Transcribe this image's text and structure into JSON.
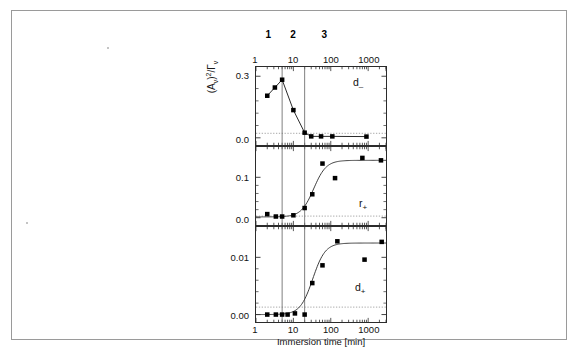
{
  "figure": {
    "y_axis_title_html": "(A<sub>v</sub>)<sup>2</sup>/Γ<sub>v</sub>",
    "y_axis_title_text": "(Av)2/Γv",
    "x_axis_title": "Immersion time [min]",
    "x_tick_labels": [
      "1",
      "10",
      "100",
      "1000"
    ],
    "x_tick_values": [
      1,
      10,
      100,
      1000
    ],
    "region_labels": [
      "1",
      "2",
      "3"
    ],
    "region_boundaries": [
      5,
      20
    ],
    "axis_color": "#2b2b2b",
    "marker_color": "#000000",
    "guide_color": "#6e6e6e",
    "dotted_color": "#9b9b9b"
  },
  "panels": [
    {
      "name": "d_minus",
      "label_html": "d<sub>–</sub>",
      "label_text": "d-",
      "y_tick_labels": [
        "0.3",
        "0.0"
      ],
      "y_tick_values": [
        0.3,
        0.0
      ],
      "y_limits": [
        -0.035,
        0.345
      ],
      "dotted_level": 0.022
    },
    {
      "name": "r_plus",
      "label_html": "r<sub>+</sub>",
      "label_text": "r+",
      "y_tick_labels": [
        "0.1",
        "0.0"
      ],
      "y_tick_values": [
        0.1,
        0.0
      ],
      "y_limits": [
        -0.018,
        0.175
      ],
      "dotted_level": 0.004
    },
    {
      "name": "d_plus",
      "label_html": "d<sub>+</sub>",
      "label_text": "d+",
      "y_tick_labels": [
        "0.01",
        "0.00"
      ],
      "y_tick_values": [
        0.01,
        0.0
      ],
      "y_limits": [
        -0.0013,
        0.0153
      ],
      "dotted_level": 0.0013
    }
  ],
  "chart_data": [
    {
      "type": "scatter",
      "title": "d–",
      "xlabel": "Immersion time [min]",
      "ylabel": "(Av)2/Γv",
      "xscale": "log",
      "xlim": [
        1,
        3000
      ],
      "ylim": [
        -0.035,
        0.345
      ],
      "grid": false,
      "legend": "none",
      "annotations": [
        "d–",
        "region 1",
        "region 2",
        "region 3"
      ],
      "vertical_lines": [
        5,
        20
      ],
      "dotted_horizontal_line": 0.022,
      "x": [
        2,
        3.2,
        5,
        10,
        20,
        30,
        55,
        110,
        900
      ],
      "y": [
        0.205,
        0.245,
        0.283,
        0.135,
        0.025,
        0.007,
        0.007,
        0.007,
        0.006
      ],
      "connected": true
    },
    {
      "type": "scatter",
      "title": "r+",
      "xlabel": "Immersion time [min]",
      "ylabel": "(Av)2/Γv",
      "xscale": "log",
      "xlim": [
        1,
        3000
      ],
      "ylim": [
        -0.018,
        0.175
      ],
      "grid": false,
      "legend": "none",
      "annotations": [
        "r+",
        "region 1",
        "region 2",
        "region 3"
      ],
      "vertical_lines": [
        5,
        20
      ],
      "dotted_horizontal_line": 0.004,
      "x": [
        2,
        3.4,
        5,
        10,
        20,
        32,
        60,
        130,
        700,
        2200
      ],
      "y": [
        0.009,
        0.003,
        0.003,
        0.006,
        0.024,
        0.058,
        0.134,
        0.098,
        0.148,
        0.142
      ],
      "fit_curve": {
        "type": "sigmoid",
        "midpoint": 35,
        "plateau": 0.142,
        "baseline": 0.002
      }
    },
    {
      "type": "scatter",
      "title": "d+",
      "xlabel": "Immersion time [min]",
      "ylabel": "(Av)2/Γv",
      "xscale": "log",
      "xlim": [
        1,
        3000
      ],
      "ylim": [
        -0.0013,
        0.0153
      ],
      "grid": false,
      "legend": "none",
      "annotations": [
        "d+",
        "region 1",
        "region 2",
        "region 3"
      ],
      "vertical_lines": [
        5,
        20
      ],
      "dotted_horizontal_line": 0.0013,
      "x": [
        2,
        3.4,
        5,
        7,
        11,
        20,
        32,
        60,
        150,
        800,
        2300
      ],
      "y": [
        0.0,
        0.0,
        0.0,
        0.0,
        0.0002,
        0.0,
        0.0055,
        0.0086,
        0.0128,
        0.0096,
        0.0127
      ],
      "fit_curve": {
        "type": "sigmoid",
        "midpoint": 33,
        "plateau": 0.0125,
        "baseline": 0.0
      }
    }
  ]
}
